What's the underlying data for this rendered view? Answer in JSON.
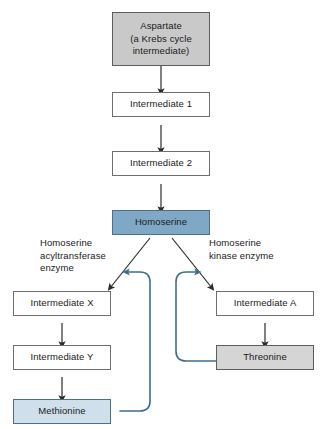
{
  "diagram": {
    "colors": {
      "start_node_fill": "#c9c9c9",
      "branch_point_fill": "#7ea8c6",
      "end_product_methionine_fill": "#cfe0ec",
      "end_product_threonine_fill": "#d5d5d5",
      "plain_node_fill": "#ffffff",
      "node_border": "#6e6e6e",
      "arrow_stroke": "#2b2b2b",
      "feedback_stroke": "#3d6e90",
      "background": "#ffffff",
      "text": "#1a1a1a"
    },
    "nodes": {
      "aspartate": "Aspartate\n(a Krebs cycle\nintermediate)",
      "intermediate_1": "Intermediate 1",
      "intermediate_2": "Intermediate 2",
      "homoserine": "Homoserine",
      "intermediate_x": "Intermediate X",
      "intermediate_y": "Intermediate Y",
      "methionine": "Methionine",
      "intermediate_a": "Intermediate A",
      "threonine": "Threonine"
    },
    "labels": {
      "enzyme_left": "Homoserine\nacyltransferase\nenzyme",
      "enzyme_right": "Homoserine\nkinase enzyme"
    },
    "edges": [
      {
        "from": "aspartate",
        "to": "intermediate_1",
        "kind": "conversion"
      },
      {
        "from": "intermediate_1",
        "to": "intermediate_2",
        "kind": "conversion"
      },
      {
        "from": "intermediate_2",
        "to": "homoserine",
        "kind": "conversion"
      },
      {
        "from": "homoserine",
        "to": "intermediate_x",
        "kind": "branch-left"
      },
      {
        "from": "homoserine",
        "to": "intermediate_a",
        "kind": "branch-right"
      },
      {
        "from": "intermediate_x",
        "to": "intermediate_y",
        "kind": "conversion"
      },
      {
        "from": "intermediate_y",
        "to": "methionine",
        "kind": "conversion"
      },
      {
        "from": "intermediate_a",
        "to": "threonine",
        "kind": "conversion"
      },
      {
        "from": "methionine",
        "to": "branch-left-arrow",
        "kind": "feedback"
      },
      {
        "from": "threonine",
        "to": "branch-right-arrow",
        "kind": "feedback"
      }
    ]
  }
}
